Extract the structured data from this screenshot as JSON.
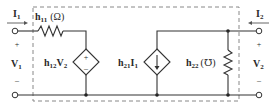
{
  "diagram": {
    "type": "h-parameter two-port equivalent circuit",
    "port1": {
      "current_label": "I",
      "current_sub": "1",
      "voltage_label": "V",
      "voltage_sub": "1",
      "plus": "+",
      "minus": "–"
    },
    "port2": {
      "current_label": "I",
      "current_sub": "2",
      "voltage_label": "V",
      "voltage_sub": "2",
      "plus": "+",
      "minus": "–"
    },
    "h11": {
      "name": "h",
      "sub": "11",
      "unit": "(Ω)"
    },
    "h12": {
      "name": "h",
      "sub": "12",
      "tail": "V",
      "tail_sub": "2",
      "plus": "+",
      "minus": "–"
    },
    "h21": {
      "name": "h",
      "sub": "21",
      "tail": "I",
      "tail_sub": "1"
    },
    "h22": {
      "name": "h",
      "sub": "22",
      "unit": "(℧)"
    },
    "colors": {
      "wire": "#333333",
      "dashed_box": "#888888",
      "text": "#2a2a2a"
    }
  }
}
